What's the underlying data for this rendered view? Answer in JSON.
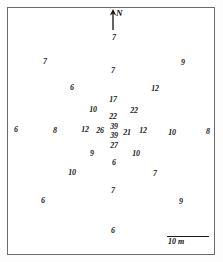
{
  "figure": {
    "background_color": "#ffffff",
    "frame_color": "#6b6b6b",
    "text_color": "#1a1a1a"
  },
  "north_arrow": {
    "label": "N",
    "icon": "north-arrow-icon"
  },
  "scale": {
    "label": "10 m",
    "length_m": 10
  },
  "chart_data": {
    "type": "scatter",
    "title": "",
    "subtitle": "",
    "xlabel": "",
    "ylabel": "",
    "grid": false,
    "legend": null,
    "annotations": [
      "N",
      "10 m"
    ],
    "axis_units": "meters",
    "value_description": "measurement value at survey point",
    "xlim": [
      0,
      223
    ],
    "ylim": [
      0,
      262
    ],
    "points": [
      {
        "label": "7",
        "x": 114,
        "y": 38
      },
      {
        "label": "7",
        "x": 45,
        "y": 62
      },
      {
        "label": "9",
        "x": 183,
        "y": 63
      },
      {
        "label": "7",
        "x": 113,
        "y": 71
      },
      {
        "label": "6",
        "x": 72,
        "y": 88
      },
      {
        "label": "12",
        "x": 155,
        "y": 89
      },
      {
        "label": "17",
        "x": 113,
        "y": 100
      },
      {
        "label": "10",
        "x": 93,
        "y": 110
      },
      {
        "label": "22",
        "x": 134,
        "y": 111
      },
      {
        "label": "22",
        "x": 113,
        "y": 117
      },
      {
        "label": "6",
        "x": 16,
        "y": 130
      },
      {
        "label": "8",
        "x": 55,
        "y": 131
      },
      {
        "label": "12",
        "x": 85,
        "y": 130
      },
      {
        "label": "26",
        "x": 100,
        "y": 131
      },
      {
        "label": "39",
        "x": 114,
        "y": 127
      },
      {
        "label": "39",
        "x": 114,
        "y": 136
      },
      {
        "label": "21",
        "x": 127,
        "y": 133
      },
      {
        "label": "12",
        "x": 143,
        "y": 131
      },
      {
        "label": "10",
        "x": 172,
        "y": 133
      },
      {
        "label": "8",
        "x": 208,
        "y": 132
      },
      {
        "label": "27",
        "x": 114,
        "y": 146
      },
      {
        "label": "9",
        "x": 92,
        "y": 154
      },
      {
        "label": "10",
        "x": 136,
        "y": 154
      },
      {
        "label": "6",
        "x": 114,
        "y": 163
      },
      {
        "label": "10",
        "x": 72,
        "y": 173
      },
      {
        "label": "7",
        "x": 155,
        "y": 174
      },
      {
        "label": "7",
        "x": 113,
        "y": 191
      },
      {
        "label": "6",
        "x": 43,
        "y": 201
      },
      {
        "label": "9",
        "x": 181,
        "y": 202
      },
      {
        "label": "6",
        "x": 113,
        "y": 231
      }
    ],
    "value_summary": {
      "min": 6,
      "max": 39,
      "count": 30,
      "center_peak": 39
    }
  }
}
